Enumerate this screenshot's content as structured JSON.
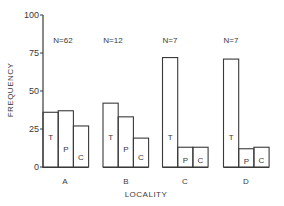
{
  "chart_data": {
    "type": "bar",
    "title": "",
    "xlabel": "LOCALITY",
    "ylabel": "FREQUENCY",
    "ylim": [
      0,
      100
    ],
    "yticks": [
      0,
      25,
      50,
      75,
      100
    ],
    "grid": false,
    "legend": "none (series letters printed inside bars)",
    "categories": [
      "A",
      "B",
      "C",
      "D"
    ],
    "sample_sizes": [
      "N=62",
      "N=12",
      "N=7",
      "N=7"
    ],
    "series": [
      {
        "name": "T",
        "values": [
          36,
          42,
          72,
          71
        ]
      },
      {
        "name": "P",
        "values": [
          37,
          33,
          13,
          12
        ]
      },
      {
        "name": "C",
        "values": [
          27,
          19,
          13,
          13
        ]
      }
    ]
  },
  "style": {
    "stroke_color": "#3a3a3a",
    "background": "#ffffff"
  }
}
